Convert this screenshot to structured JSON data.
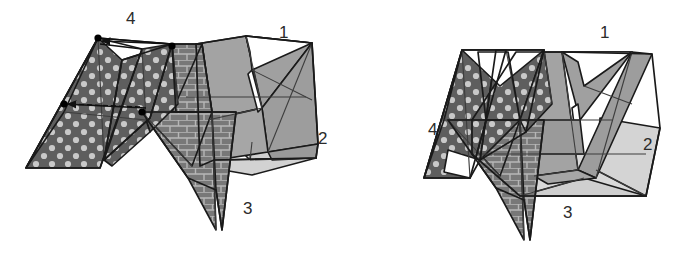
{
  "document": {
    "type": "geometric-folding-diagram",
    "description": "Two perspective views of a folded polyhedral (origami-like) surface composed of four numbered triangular panels",
    "background_color": "#ffffff",
    "stroke_color": "#1a1a1a",
    "panel_count": 4,
    "view_count": 2
  },
  "palette": {
    "outline": "#1a1a1a",
    "thin_line": "#4a4a4a",
    "panel_medium_gray": "#a3a3a3",
    "panel_light_gray": "#d9d9d9",
    "panel_pale_gray": "#c9c9c9",
    "texture_brick_base": "#787878",
    "texture_brick_mortar": "#b9b9b9",
    "texture_dot_base": "#5e5e5e",
    "texture_dot_fill": "#c9c9c9",
    "white_face": "#ffffff",
    "vertex_marker": "#000000",
    "label_text": "#2b2b2b"
  },
  "views": [
    {
      "name": "left-view",
      "id": "view-unfolded",
      "labels": [
        {
          "text": "4",
          "x": 126,
          "y": 12,
          "panel": "polka-dot"
        },
        {
          "text": "1",
          "x": 279,
          "y": 26,
          "panel": "medium-gray"
        },
        {
          "text": "2",
          "x": 318,
          "y": 132,
          "panel": "light-gray"
        },
        {
          "text": "3",
          "x": 243,
          "y": 202,
          "panel": "brick"
        }
      ],
      "annotations": {
        "vertex_markers": 4,
        "fold_arrows": 2,
        "arrow_description": "Two arrows indicating the direction of folding motion of the dotted panel toward the rest of the model"
      }
    },
    {
      "name": "right-view",
      "id": "view-folded",
      "labels": [
        {
          "text": "1",
          "x": 600,
          "y": 26,
          "panel": "medium-gray"
        },
        {
          "text": "2",
          "x": 643,
          "y": 138,
          "panel": "light-gray"
        },
        {
          "text": "3",
          "x": 563,
          "y": 206,
          "panel": "brick"
        },
        {
          "text": "4",
          "x": 428,
          "y": 123,
          "panel": "polka-dot"
        }
      ],
      "annotations": {
        "vertex_markers": 0,
        "fold_arrows": 0,
        "arrow_description": ""
      }
    }
  ],
  "panels": [
    {
      "number": "1",
      "texture": "solid-medium-gray",
      "fill": "#a3a3a3"
    },
    {
      "number": "2",
      "texture": "solid-light-gray",
      "fill": "#d9d9d9"
    },
    {
      "number": "3",
      "texture": "brick",
      "fill": "#787878"
    },
    {
      "number": "4",
      "texture": "polka-dot",
      "fill": "#5e5e5e"
    }
  ]
}
